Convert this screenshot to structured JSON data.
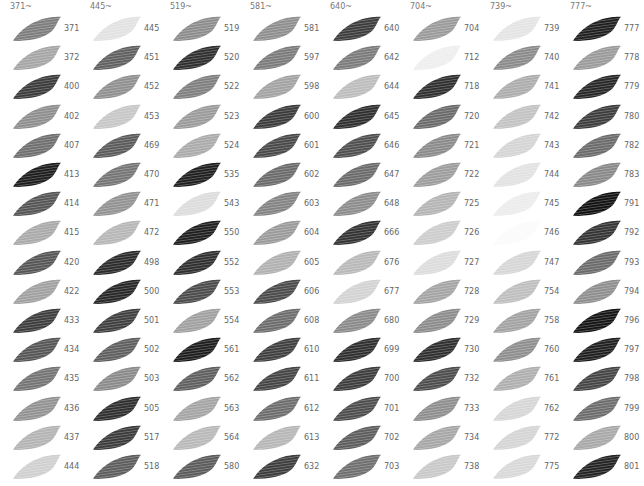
{
  "columns": [
    {
      "header": "371~",
      "items": [
        {
          "code": "371",
          "shade": "#7c7c7c"
        },
        {
          "code": "372",
          "shade": "#a5a5a5"
        },
        {
          "code": "400",
          "shade": "#3a3a3a"
        },
        {
          "code": "402",
          "shade": "#8e8e8e"
        },
        {
          "code": "407",
          "shade": "#6e6e6e"
        },
        {
          "code": "413",
          "shade": "#1c1c1c"
        },
        {
          "code": "414",
          "shade": "#545454"
        },
        {
          "code": "415",
          "shade": "#a9a9a9"
        },
        {
          "code": "420",
          "shade": "#555555"
        },
        {
          "code": "422",
          "shade": "#a0a0a0"
        },
        {
          "code": "433",
          "shade": "#3c3c3c"
        },
        {
          "code": "434",
          "shade": "#555555"
        },
        {
          "code": "435",
          "shade": "#737373"
        },
        {
          "code": "436",
          "shade": "#929292"
        },
        {
          "code": "437",
          "shade": "#b3b3b3"
        },
        {
          "code": "444",
          "shade": "#cfcfcf"
        }
      ]
    },
    {
      "header": "445~",
      "items": [
        {
          "code": "445",
          "shade": "#e2e2e2"
        },
        {
          "code": "451",
          "shade": "#5f5f5f"
        },
        {
          "code": "452",
          "shade": "#8f8f8f"
        },
        {
          "code": "453",
          "shade": "#c6c6c6"
        },
        {
          "code": "469",
          "shade": "#5a5a5a"
        },
        {
          "code": "470",
          "shade": "#747474"
        },
        {
          "code": "471",
          "shade": "#929292"
        },
        {
          "code": "472",
          "shade": "#b6b6b6"
        },
        {
          "code": "498",
          "shade": "#2a2a2a"
        },
        {
          "code": "500",
          "shade": "#262626"
        },
        {
          "code": "501",
          "shade": "#3e3e3e"
        },
        {
          "code": "502",
          "shade": "#5e5e5e"
        },
        {
          "code": "503",
          "shade": "#8a8a8a"
        },
        {
          "code": "505",
          "shade": "#2e2e2e"
        },
        {
          "code": "517",
          "shade": "#3a3a3a"
        },
        {
          "code": "518",
          "shade": "#5c5c5c"
        }
      ]
    },
    {
      "header": "519~",
      "items": [
        {
          "code": "519",
          "shade": "#8c8c8c"
        },
        {
          "code": "520",
          "shade": "#2e2e2e"
        },
        {
          "code": "522",
          "shade": "#7e7e7e"
        },
        {
          "code": "523",
          "shade": "#9a9a9a"
        },
        {
          "code": "524",
          "shade": "#aaaaaa"
        },
        {
          "code": "535",
          "shade": "#1e1e1e"
        },
        {
          "code": "543",
          "shade": "#dcdcdc"
        },
        {
          "code": "550",
          "shade": "#1e1e1e"
        },
        {
          "code": "552",
          "shade": "#2e2e2e"
        },
        {
          "code": "553",
          "shade": "#4a4a4a"
        },
        {
          "code": "554",
          "shade": "#a0a0a0"
        },
        {
          "code": "561",
          "shade": "#1c1c1c"
        },
        {
          "code": "562",
          "shade": "#5e5e5e"
        },
        {
          "code": "563",
          "shade": "#a4a4a4"
        },
        {
          "code": "564",
          "shade": "#b8b8b8"
        },
        {
          "code": "580",
          "shade": "#5a5a5a"
        }
      ]
    },
    {
      "header": "581~",
      "items": [
        {
          "code": "581",
          "shade": "#8e8e8e"
        },
        {
          "code": "597",
          "shade": "#7a7a7a"
        },
        {
          "code": "598",
          "shade": "#a2a2a2"
        },
        {
          "code": "600",
          "shade": "#3a3a3a"
        },
        {
          "code": "601",
          "shade": "#484848"
        },
        {
          "code": "602",
          "shade": "#6a6a6a"
        },
        {
          "code": "603",
          "shade": "#838383"
        },
        {
          "code": "604",
          "shade": "#9a9a9a"
        },
        {
          "code": "605",
          "shade": "#b0b0b0"
        },
        {
          "code": "606",
          "shade": "#4a4a4a"
        },
        {
          "code": "608",
          "shade": "#6c6c6c"
        },
        {
          "code": "610",
          "shade": "#3e3e3e"
        },
        {
          "code": "611",
          "shade": "#444444"
        },
        {
          "code": "612",
          "shade": "#6c6c6c"
        },
        {
          "code": "613",
          "shade": "#b6b6b6"
        },
        {
          "code": "632",
          "shade": "#3c3c3c"
        }
      ]
    },
    {
      "header": "640~",
      "items": [
        {
          "code": "640",
          "shade": "#3c3c3c"
        },
        {
          "code": "642",
          "shade": "#7a7a7a"
        },
        {
          "code": "644",
          "shade": "#bcbcbc"
        },
        {
          "code": "645",
          "shade": "#2e2e2e"
        },
        {
          "code": "646",
          "shade": "#4e4e4e"
        },
        {
          "code": "647",
          "shade": "#6a6a6a"
        },
        {
          "code": "648",
          "shade": "#8c8c8c"
        },
        {
          "code": "666",
          "shade": "#323232"
        },
        {
          "code": "676",
          "shade": "#b8b8b8"
        },
        {
          "code": "677",
          "shade": "#d2d2d2"
        },
        {
          "code": "680",
          "shade": "#8a8a8a"
        },
        {
          "code": "699",
          "shade": "#2e2e2e"
        },
        {
          "code": "700",
          "shade": "#3c3c3c"
        },
        {
          "code": "701",
          "shade": "#4c4c4c"
        },
        {
          "code": "702",
          "shade": "#5c5c5c"
        },
        {
          "code": "703",
          "shade": "#6e6e6e"
        }
      ]
    },
    {
      "header": "704~",
      "items": [
        {
          "code": "704",
          "shade": "#9a9a9a"
        },
        {
          "code": "712",
          "shade": "#eeeeee"
        },
        {
          "code": "718",
          "shade": "#2e2e2e"
        },
        {
          "code": "720",
          "shade": "#6a6a6a"
        },
        {
          "code": "721",
          "shade": "#8a8a8a"
        },
        {
          "code": "722",
          "shade": "#9c9c9c"
        },
        {
          "code": "725",
          "shade": "#b4b4b4"
        },
        {
          "code": "726",
          "shade": "#cccccc"
        },
        {
          "code": "727",
          "shade": "#dcdcdc"
        },
        {
          "code": "728",
          "shade": "#a4a4a4"
        },
        {
          "code": "729",
          "shade": "#8c8c8c"
        },
        {
          "code": "730",
          "shade": "#2e2e2e"
        },
        {
          "code": "732",
          "shade": "#4c4c4c"
        },
        {
          "code": "733",
          "shade": "#8e8e8e"
        },
        {
          "code": "734",
          "shade": "#a6a6a6"
        },
        {
          "code": "738",
          "shade": "#c8c8c8"
        }
      ]
    },
    {
      "header": "739~",
      "items": [
        {
          "code": "739",
          "shade": "#e4e4e4"
        },
        {
          "code": "740",
          "shade": "#8a8a8a"
        },
        {
          "code": "741",
          "shade": "#acacac"
        },
        {
          "code": "742",
          "shade": "#c2c2c2"
        },
        {
          "code": "743",
          "shade": "#d4d4d4"
        },
        {
          "code": "744",
          "shade": "#e2e2e2"
        },
        {
          "code": "745",
          "shade": "#ececec"
        },
        {
          "code": "746",
          "shade": "#fbfbfb"
        },
        {
          "code": "747",
          "shade": "#d6d6d6"
        },
        {
          "code": "754",
          "shade": "#bebebe"
        },
        {
          "code": "758",
          "shade": "#a2a2a2"
        },
        {
          "code": "760",
          "shade": "#8e8e8e"
        },
        {
          "code": "761",
          "shade": "#aeaeae"
        },
        {
          "code": "762",
          "shade": "#d6d6d6"
        },
        {
          "code": "772",
          "shade": "#d4d4d4"
        },
        {
          "code": "775",
          "shade": "#d8d8d8"
        }
      ]
    },
    {
      "header": "777~",
      "items": [
        {
          "code": "777",
          "shade": "#1e1e1e"
        },
        {
          "code": "778",
          "shade": "#9a9a9a"
        },
        {
          "code": "779",
          "shade": "#262626"
        },
        {
          "code": "780",
          "shade": "#3c3c3c"
        },
        {
          "code": "782",
          "shade": "#6a6a6a"
        },
        {
          "code": "783",
          "shade": "#888888"
        },
        {
          "code": "791",
          "shade": "#111111"
        },
        {
          "code": "792",
          "shade": "#333333"
        },
        {
          "code": "793",
          "shade": "#6a6a6a"
        },
        {
          "code": "794",
          "shade": "#8e8e8e"
        },
        {
          "code": "796",
          "shade": "#141414"
        },
        {
          "code": "797",
          "shade": "#1e1e1e"
        },
        {
          "code": "798",
          "shade": "#444444"
        },
        {
          "code": "799",
          "shade": "#6c6c6c"
        },
        {
          "code": "800",
          "shade": "#a8a8a8"
        },
        {
          "code": "801",
          "shade": "#222222"
        }
      ]
    }
  ]
}
